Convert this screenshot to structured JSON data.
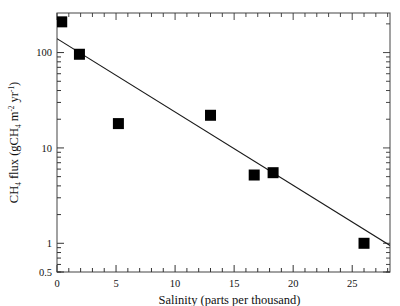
{
  "chart_data": {
    "type": "scatter",
    "title": "",
    "xlabel": "Salinity (parts per thousand)",
    "ylabel_parts": {
      "prefix": "CH",
      "sub1": "4",
      "mid": " flux  (gCH",
      "sub2": "4",
      "mid2": "  m",
      "sup1": "-2",
      "mid3": "  yr",
      "sup2": "-1",
      "suffix": ")"
    },
    "ylabel": "CH4 flux (gCH4 m-2 yr-1)",
    "yscale": "log",
    "xscale": "linear",
    "xlim": [
      0,
      28.2
    ],
    "ylim": [
      0.5,
      260
    ],
    "grid": false,
    "legend": null,
    "x_major_ticks": [
      0,
      5,
      10,
      15,
      20,
      25
    ],
    "x_major_tick_labels": [
      "0",
      "5",
      "10",
      "15",
      "20",
      "25"
    ],
    "x_minor_tick_step": 1,
    "y_major_ticks": [
      0.5,
      1,
      10,
      100
    ],
    "y_major_tick_labels": [
      "0.5",
      "1",
      "10",
      "100"
    ],
    "marker": "filled-square",
    "marker_color": "#000000",
    "marker_size_px": 11,
    "points": [
      {
        "x": 0.4,
        "y": 210.0
      },
      {
        "x": 1.9,
        "y": 96.0
      },
      {
        "x": 5.2,
        "y": 18.0
      },
      {
        "x": 13.0,
        "y": 22.0
      },
      {
        "x": 16.7,
        "y": 5.2
      },
      {
        "x": 18.3,
        "y": 5.5
      },
      {
        "x": 26.0,
        "y": 1.0
      }
    ],
    "trendline": {
      "type": "log-linear-fit",
      "color": "#1a1a1a",
      "x_start": 0.0,
      "y_start": 140.0,
      "x_end": 28.2,
      "y_end": 0.95
    }
  },
  "axes": {
    "frame_color": "#555555",
    "tick_color": "#333333"
  }
}
